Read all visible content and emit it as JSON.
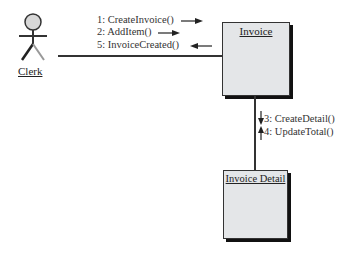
{
  "diagram": {
    "type": "UML communication diagram",
    "actor": {
      "label": "Clerk"
    },
    "objects": [
      {
        "id": "invoice",
        "label": "Invoice"
      },
      {
        "id": "invoice_detail",
        "label": "Invoice Detail"
      }
    ],
    "links": [
      {
        "from": "Clerk",
        "to": "Invoice",
        "messages": [
          {
            "label": "1: CreateInvoice()",
            "direction": "right"
          },
          {
            "label": "2: AddItem()",
            "direction": "right"
          },
          {
            "label": "5: InvoiceCreated()",
            "direction": "left"
          }
        ]
      },
      {
        "from": "Invoice",
        "to": "Invoice Detail",
        "messages": [
          {
            "label": "3: CreateDetail()",
            "direction": "down"
          },
          {
            "label": "4: UpdateTotal()",
            "direction": "up"
          }
        ]
      }
    ]
  }
}
